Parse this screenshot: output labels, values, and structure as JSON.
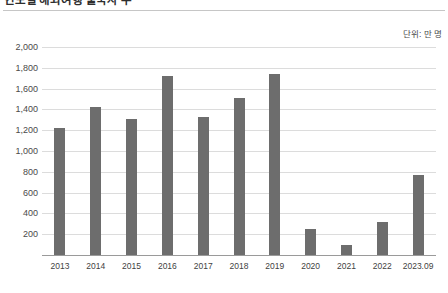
{
  "header": {
    "title": "연도별 해외여행 출국자 수",
    "title_clipped": true
  },
  "unit_note": "단위: 만 명",
  "chart_data": {
    "type": "bar",
    "title": "연도별 해외여행 출국자 수",
    "xlabel": "",
    "ylabel": "",
    "unit": "단위: 만 명",
    "categories": [
      "2013",
      "2014",
      "2015",
      "2016",
      "2017",
      "2018",
      "2019",
      "2020",
      "2021",
      "2022",
      "2023.09"
    ],
    "values": [
      1220,
      1420,
      1310,
      1720,
      1330,
      1510,
      1740,
      250,
      100,
      320,
      770
    ],
    "ylim": [
      0,
      2000
    ],
    "ytick_labels": [
      "2,000",
      "1,800",
      "1,600",
      "1,400",
      "1,200",
      "1,000",
      "800",
      "600",
      "400",
      "200"
    ],
    "ytick_values": [
      2000,
      1800,
      1600,
      1400,
      1200,
      1000,
      800,
      600,
      400,
      200
    ],
    "grid": true,
    "legend": "none",
    "bar_color": "#6d6d6d",
    "gridline_color": "#dcdcdc",
    "axis_color": "#9a9a9a"
  }
}
